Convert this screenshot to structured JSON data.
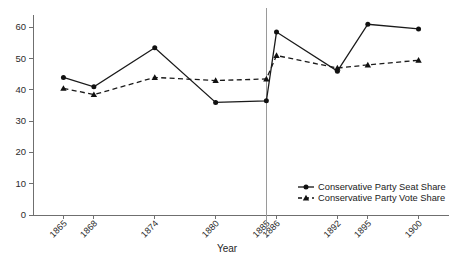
{
  "chart_data": {
    "type": "line",
    "title": "",
    "xlabel": "Year",
    "ylabel": "",
    "x": [
      1865,
      1868,
      1874,
      1880,
      1885,
      1886,
      1892,
      1895,
      1900
    ],
    "categories": [
      "1865",
      "1868",
      "1874",
      "1880",
      "1885",
      "1886",
      "1892",
      "1895",
      "1900"
    ],
    "series": [
      {
        "name": "Conservative Party Seat Share",
        "values": [
          44.0,
          41.0,
          53.5,
          36.0,
          36.5,
          58.5,
          46.0,
          61.0,
          59.5
        ],
        "linestyle": "solid",
        "marker": "circle",
        "color": "#111111"
      },
      {
        "name": "Conservative Party Vote Share",
        "values": [
          40.5,
          38.5,
          44.0,
          43.0,
          43.5,
          51.0,
          47.0,
          48.0,
          49.5
        ],
        "linestyle": "dashed",
        "marker": "triangle",
        "color": "#111111"
      }
    ],
    "ylim": [
      0,
      63
    ],
    "yticks": [
      0,
      10,
      20,
      30,
      40,
      50,
      60
    ],
    "ytick_labels": [
      "0",
      "10",
      "20",
      "30",
      "40",
      "50",
      "60"
    ],
    "xlim": [
      1862,
      1903
    ],
    "grid": false,
    "legend_position": "lower right",
    "annotations": [
      {
        "type": "vertical-reference-line",
        "x": 1885,
        "color": "#9a9a9a"
      }
    ]
  },
  "axes": {
    "x_title": "Year",
    "y_title": ""
  },
  "legend": {
    "items": [
      {
        "label": "Conservative Party Seat Share",
        "marker": "circle",
        "linestyle": "solid"
      },
      {
        "label": "Conservative Party Vote Share",
        "marker": "triangle",
        "linestyle": "dashed"
      }
    ]
  },
  "colors": {
    "ink": "#111111",
    "axis": "#6f6f6f",
    "reference_line": "#9a9a9a",
    "background": "#ffffff"
  }
}
